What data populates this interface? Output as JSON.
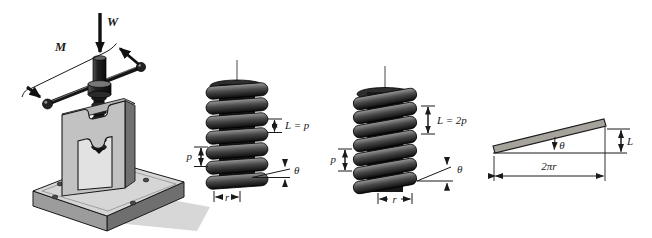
{
  "figure_labels": {
    "jack": {
      "load": "W",
      "moment": "M"
    },
    "screw_single": {
      "lead": "L = p",
      "pitch": "p",
      "angle": "θ",
      "radius": "r"
    },
    "screw_double": {
      "lead": "L = 2p",
      "pitch": "p",
      "angle": "θ",
      "radius": "r"
    },
    "incline": {
      "angle": "θ",
      "base": "2πr",
      "height": "L"
    }
  },
  "colors": {
    "paper": "#ffffff",
    "ink": "#1a1a1a",
    "steel_light": "#d6d6d6",
    "steel_mid": "#9c9c9c",
    "steel_dark": "#6f6f6f",
    "thread_dark": "#141414",
    "incline_bar": "#a6a39c"
  }
}
